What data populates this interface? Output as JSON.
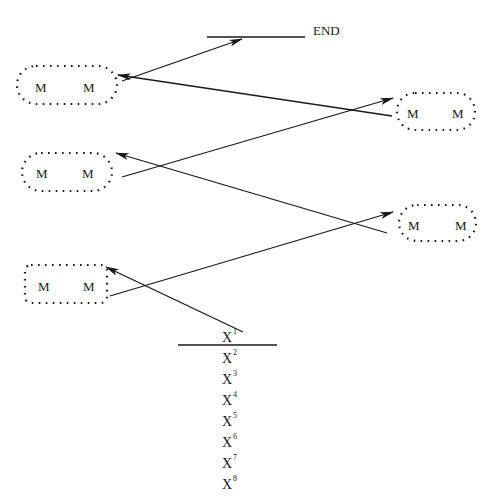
{
  "end_label": "END",
  "colors": {
    "ink": "#1a1a1a",
    "background": "#ffffff"
  },
  "nodes": [
    {
      "id": "A",
      "labels": [
        "M",
        "M"
      ]
    },
    {
      "id": "B",
      "labels": [
        "M",
        "M"
      ]
    },
    {
      "id": "C",
      "labels": [
        "M",
        "M"
      ]
    },
    {
      "id": "D",
      "labels": [
        "M",
        "M"
      ]
    },
    {
      "id": "E",
      "labels": [
        "M",
        "M"
      ]
    }
  ],
  "x_list": {
    "base": "X",
    "items": [
      {
        "base": "X",
        "sup": "1"
      },
      {
        "base": "X",
        "sup": "2"
      },
      {
        "base": "X",
        "sup": "3"
      },
      {
        "base": "X",
        "sup": "4"
      },
      {
        "base": "X",
        "sup": "5"
      },
      {
        "base": "X",
        "sup": "6"
      },
      {
        "base": "X",
        "sup": "7"
      },
      {
        "base": "X",
        "sup": "8"
      }
    ]
  },
  "edges": [
    {
      "from": "X1",
      "to": "E"
    },
    {
      "from": "E",
      "to": "D"
    },
    {
      "from": "D",
      "to": "C"
    },
    {
      "from": "C",
      "to": "B"
    },
    {
      "from": "B",
      "to": "A"
    },
    {
      "from": "A",
      "to": "END"
    }
  ]
}
